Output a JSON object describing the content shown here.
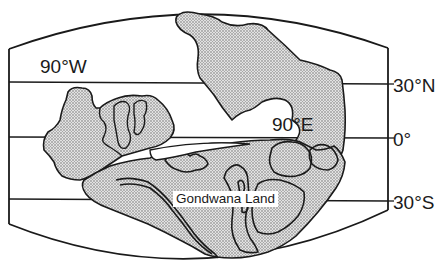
{
  "map": {
    "title": "Gondwana Land",
    "projection": "curved-frame paleogeographic reconstruction",
    "colors": {
      "outline": "#1a1a1a",
      "land_fill": "#d8d8d8",
      "stipple": "#7a7a7a",
      "background": "#ffffff"
    },
    "latitude_labels": [
      {
        "id": "lat-30n",
        "text": "30°N"
      },
      {
        "id": "lat-0",
        "text": "0°"
      },
      {
        "id": "lat-30s",
        "text": "30°S"
      }
    ],
    "longitude_labels": [
      {
        "id": "lon-90w",
        "text": "90°W"
      },
      {
        "id": "lon-90e",
        "text": "90°E"
      }
    ],
    "region_labels": [
      {
        "id": "gondwana",
        "text": "Gondwana Land"
      }
    ]
  }
}
